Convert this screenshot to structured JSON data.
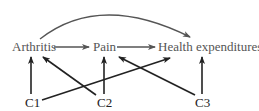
{
  "diagram": {
    "type": "causal-dag",
    "colors": {
      "top_row": "#555555",
      "confounders": "#222222",
      "background": "#ffffff"
    },
    "nodes": [
      {
        "id": "arthritis",
        "label": "Arthritis",
        "x": 12,
        "y": 51
      },
      {
        "id": "pain",
        "label": "Pain",
        "x": 93,
        "y": 51
      },
      {
        "id": "health",
        "label": "Health expenditures",
        "x": 158,
        "y": 51
      },
      {
        "id": "c1",
        "label": "C1",
        "x": 25,
        "y": 107
      },
      {
        "id": "c2",
        "label": "C2",
        "x": 97,
        "y": 107
      },
      {
        "id": "c3",
        "label": "C3",
        "x": 195,
        "y": 107
      }
    ],
    "edges": [
      {
        "from": "arthritis",
        "to": "health",
        "style": "curved"
      },
      {
        "from": "arthritis",
        "to": "pain",
        "style": "straight"
      },
      {
        "from": "pain",
        "to": "health",
        "style": "straight"
      },
      {
        "from": "c1",
        "to": "arthritis",
        "style": "straight"
      },
      {
        "from": "c1",
        "to": "health",
        "style": "straight"
      },
      {
        "from": "c2",
        "to": "arthritis",
        "style": "straight"
      },
      {
        "from": "c2",
        "to": "pain",
        "style": "straight"
      },
      {
        "from": "c3",
        "to": "pain",
        "style": "straight"
      },
      {
        "from": "c3",
        "to": "health",
        "style": "straight"
      }
    ]
  }
}
